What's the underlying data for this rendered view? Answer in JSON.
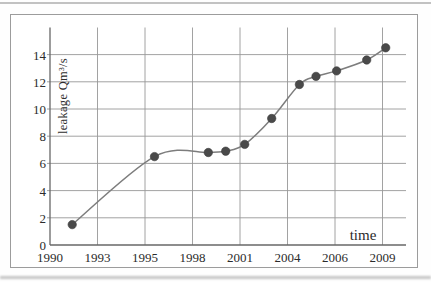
{
  "chart_data": {
    "type": "line",
    "title": "",
    "xlabel": "time",
    "ylabel": "leakage Qm³/s",
    "x_tick_years": [
      1990,
      1993,
      1995,
      1998,
      2001,
      2004,
      2006,
      2009
    ],
    "y_ticks": [
      0,
      2,
      4,
      6,
      8,
      10,
      12,
      14
    ],
    "ylim": [
      0,
      16
    ],
    "grid": true,
    "legend": "none",
    "marker_style": "filled-circle",
    "line_style": "smooth",
    "series": [
      {
        "x": [
          1991.4,
          1995.6,
          1999.0,
          2000.1,
          2001.3,
          2003.0,
          2004.5,
          2005.2,
          2006.1,
          2008.0,
          2009.2
        ],
        "y": [
          1.5,
          6.5,
          6.8,
          6.9,
          7.4,
          9.3,
          11.8,
          12.4,
          12.8,
          13.6,
          14.5
        ]
      }
    ],
    "colors": {
      "line": "#7d7d7d",
      "marker": "#4a4a4a",
      "marker_edge": "#3a3a3a",
      "grid": "#979797",
      "axis": "#676767",
      "frame": "#9c9c9c",
      "text": "#2b2b2b"
    }
  }
}
